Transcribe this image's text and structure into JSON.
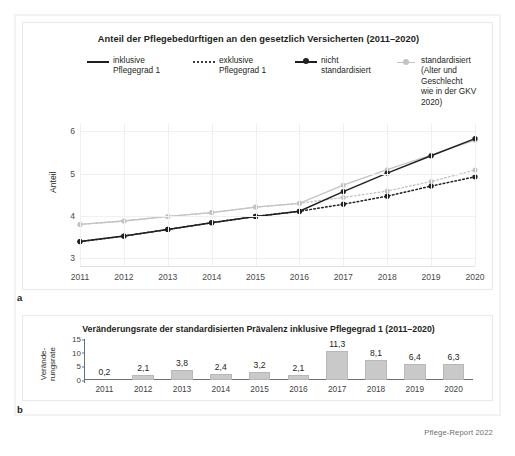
{
  "figure": {
    "source_caption": "Pflege-Report 2022",
    "panel_a_letter": "a",
    "panel_b_letter": "b"
  },
  "panel_a": {
    "title": "Anteil der Pflegebedürftigen an den gesetzlich Versicherten (2011–2020)",
    "ylabel": "Anteil",
    "legend": [
      {
        "label": "inklusive\nPflegegrad 1",
        "marker": "line-solid-black"
      },
      {
        "label": "exklusive\nPflegegrad 1",
        "marker": "line-dotted-black"
      },
      {
        "label": "nicht\nstandardisiert",
        "marker": "line-solid-black-dot"
      },
      {
        "label": "standardisiert\n(Alter und Geschlecht\nwie in der GKV 2020)",
        "marker": "line-solid-gray-dot"
      }
    ]
  },
  "panel_b": {
    "title": "Veränderungsrate der standardisierten Prävalenz inklusive Pflegegrad 1 (2011–2020)",
    "ylabel": "Verände-\nrungsrate"
  },
  "chart_data": [
    {
      "type": "line",
      "panel": "a",
      "title": "Anteil der Pflegebedürftigen an den gesetzlich Versicherten (2011–2020)",
      "xlabel": "",
      "ylabel": "Anteil",
      "x": [
        2011,
        2012,
        2013,
        2014,
        2015,
        2016,
        2017,
        2018,
        2019,
        2020
      ],
      "xticklabels": [
        "2011",
        "2012",
        "2013",
        "2014",
        "2015",
        "2016",
        "2017",
        "2018",
        "2019",
        "2020"
      ],
      "yticklabels": [
        "3",
        "4",
        "5",
        "6"
      ],
      "ylim": [
        2.8,
        6.2
      ],
      "yticks": [
        3,
        4,
        5,
        6
      ],
      "grid": true,
      "legend_position": "top",
      "series": [
        {
          "name": "inklusive Pflegegrad 1, nicht standardisiert",
          "style": "solid",
          "color": "#231f20",
          "marker": "circle",
          "values": [
            3.38,
            3.51,
            3.67,
            3.83,
            3.98,
            4.1,
            4.57,
            5.01,
            5.42,
            5.83
          ]
        },
        {
          "name": "inklusive Pflegegrad 1, standardisiert (Alter und Geschlecht wie in der GKV 2020)",
          "style": "solid",
          "color": "#c3c3c3",
          "marker": "circle",
          "values": [
            3.79,
            3.87,
            3.98,
            4.07,
            4.2,
            4.29,
            4.72,
            5.09,
            5.44,
            5.79
          ]
        },
        {
          "name": "exklusive Pflegegrad 1, nicht standardisiert",
          "style": "dotted",
          "color": "#231f20",
          "marker": "circle",
          "values": [
            3.38,
            3.51,
            3.67,
            3.83,
            3.98,
            4.1,
            4.27,
            4.46,
            4.7,
            4.92
          ]
        },
        {
          "name": "exklusive Pflegegrad 1, standardisiert (Alter und Geschlecht wie in der GKV 2020)",
          "style": "dotted",
          "color": "#c3c3c3",
          "marker": "circle",
          "values": [
            3.79,
            3.87,
            3.98,
            4.07,
            4.2,
            4.29,
            4.43,
            4.58,
            4.81,
            5.08
          ]
        }
      ]
    },
    {
      "type": "bar",
      "panel": "b",
      "title": "Veränderungsrate der standardisierten Prävalenz inklusive Pflegegrad 1 (2011–2020)",
      "xlabel": "",
      "ylabel": "Veränderungsrate",
      "categories": [
        "2011",
        "2012",
        "2013",
        "2014",
        "2015",
        "2016",
        "2017",
        "2018",
        "2019",
        "2020"
      ],
      "values": [
        0.2,
        2.1,
        3.8,
        2.4,
        3.2,
        2.1,
        11.3,
        8.1,
        6.4,
        6.3
      ],
      "value_labels": [
        "0,2",
        "2,1",
        "3,8",
        "2,4",
        "3,2",
        "2,1",
        "11,3",
        "8,1",
        "6,4",
        "6,3"
      ],
      "yticks": [
        0,
        5,
        10,
        15
      ],
      "yticklabels": [
        "0",
        "5",
        "10",
        "15"
      ],
      "ylim": [
        0,
        15
      ],
      "bar_color": "#c9c9c9",
      "grid": false
    }
  ]
}
